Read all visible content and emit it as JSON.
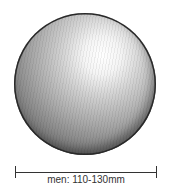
{
  "illustration": {
    "subject": "sphere-ball",
    "colors": {
      "highlight": "#ffffff",
      "midtone": "#a8a8a8",
      "shadow": "#3c3c3c",
      "line": "#333333"
    }
  },
  "dimension": {
    "label": "men: 110-130mm"
  }
}
